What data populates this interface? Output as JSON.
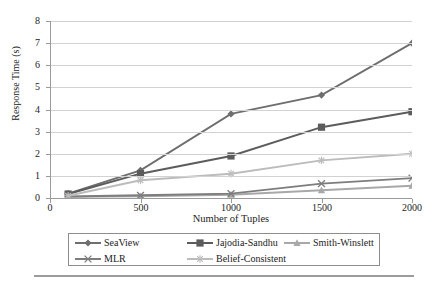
{
  "chart_data": {
    "type": "line",
    "title": "",
    "xlabel": "Number of Tuples",
    "ylabel": "Response Time (s)",
    "xlim": [
      0,
      2000
    ],
    "ylim": [
      0,
      8
    ],
    "xticks": [
      0,
      500,
      1000,
      1500,
      2000
    ],
    "yticks": [
      0,
      1,
      2,
      3,
      4,
      5,
      6,
      7,
      8
    ],
    "grid": true,
    "legend_position": "bottom",
    "x": [
      100,
      500,
      1000,
      1500,
      2000
    ],
    "series": [
      {
        "name": "SeaView",
        "marker": "diamond",
        "color": "#6e6e6e",
        "values": [
          0.2,
          1.25,
          3.8,
          4.65,
          7.0
        ]
      },
      {
        "name": "Jajodia-Sandhu",
        "marker": "square",
        "color": "#5c5c5c",
        "values": [
          0.18,
          1.1,
          1.9,
          3.2,
          3.9
        ]
      },
      {
        "name": "Smith-Winslett",
        "marker": "triangle",
        "color": "#a8a8a8",
        "values": [
          0.05,
          0.08,
          0.15,
          0.35,
          0.55
        ]
      },
      {
        "name": "MLR",
        "marker": "x",
        "color": "#7d7d7d",
        "values": [
          0.07,
          0.12,
          0.2,
          0.65,
          0.9
        ]
      },
      {
        "name": "Belief-Consistent",
        "marker": "star",
        "color": "#bcbcbc",
        "values": [
          0.1,
          0.8,
          1.1,
          1.7,
          2.0
        ]
      }
    ]
  },
  "axis": {
    "ytick_labels": [
      "0",
      "1",
      "2",
      "3",
      "4",
      "5",
      "6",
      "7",
      "8"
    ],
    "xtick_labels": [
      "0",
      "500",
      "1000",
      "1500",
      "2000"
    ],
    "ylabel": "Response Time (s)",
    "xlabel": "Number of Tuples"
  },
  "legend": {
    "entries": [
      {
        "label": "SeaView"
      },
      {
        "label": "Jajodia-Sandhu"
      },
      {
        "label": "Smith-Winslett"
      },
      {
        "label": "MLR"
      },
      {
        "label": "Belief-Consistent"
      }
    ]
  }
}
